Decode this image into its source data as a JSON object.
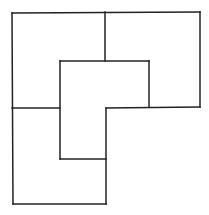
{
  "diagram": {
    "stroke_color": "#222222",
    "background": "#ffffff",
    "stroke_width": 1.5,
    "segments": [
      [
        12,
        13,
        200,
        12
      ],
      [
        200,
        12,
        200,
        107
      ],
      [
        200,
        107,
        106,
        108
      ],
      [
        106,
        108,
        106,
        204
      ],
      [
        106,
        204,
        13,
        204
      ],
      [
        13,
        204,
        12,
        13
      ],
      [
        105,
        12,
        105,
        61
      ],
      [
        60,
        61,
        149,
        61
      ],
      [
        149,
        61,
        149,
        107
      ],
      [
        60,
        61,
        60,
        159
      ],
      [
        60,
        159,
        106,
        159
      ],
      [
        12,
        108,
        60,
        108
      ]
    ]
  }
}
